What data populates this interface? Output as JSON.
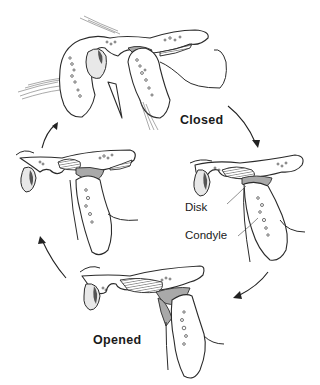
{
  "diagram": {
    "stages": [
      {
        "id": "closed",
        "label": "Closed"
      },
      {
        "id": "intermediate-right",
        "label": ""
      },
      {
        "id": "opened",
        "label": "Opened"
      },
      {
        "id": "intermediate-left",
        "label": ""
      }
    ],
    "annotations": {
      "disk": "Disk",
      "condyle": "Condyle"
    },
    "cycle_direction": "clockwise",
    "colors": {
      "line": "#2b2b2b",
      "disk_fill": "#a9a9a9",
      "background": "#ffffff"
    }
  }
}
